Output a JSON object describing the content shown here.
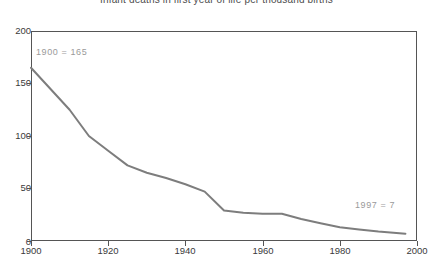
{
  "chart_data": {
    "type": "line",
    "title": "Infant deaths in first year of life per thousand births",
    "xlabel": "",
    "ylabel": "",
    "xlim": [
      1900,
      2000
    ],
    "ylim": [
      0,
      200
    ],
    "grid": false,
    "legend": null,
    "line_color": "#7d7d7d",
    "axis_color": "#555555",
    "annotation_color": "#9a9a9a",
    "xticks": [
      1900,
      1920,
      1940,
      1960,
      1980,
      2000
    ],
    "xtick_labels": [
      "1900",
      "1920",
      "1940",
      "1960",
      "1980",
      "2000"
    ],
    "yticks": [
      0,
      50,
      100,
      150,
      200
    ],
    "ytick_labels": [
      "0",
      "50",
      "100",
      "150",
      "200"
    ],
    "x": [
      1900,
      1905,
      1910,
      1915,
      1920,
      1925,
      1930,
      1935,
      1940,
      1945,
      1950,
      1955,
      1960,
      1965,
      1970,
      1975,
      1980,
      1985,
      1990,
      1997
    ],
    "values": [
      165,
      145,
      125,
      100,
      86,
      72,
      65,
      60,
      54,
      47,
      29,
      27,
      26,
      26,
      21,
      17,
      13,
      11,
      9,
      7
    ],
    "series": [
      {
        "name": "Infant deaths per thousand births",
        "values": [
          165,
          145,
          125,
          100,
          86,
          72,
          65,
          60,
          54,
          47,
          29,
          27,
          26,
          26,
          21,
          17,
          13,
          11,
          9,
          7
        ]
      }
    ],
    "annotations": [
      {
        "text": "1900  =  165",
        "x": 1900,
        "y": 165
      },
      {
        "text": "1997  =  7",
        "x": 1997,
        "y": 7
      }
    ]
  },
  "labels": {
    "annotation_start": "1900  =  165",
    "annotation_end": "1997  =  7"
  }
}
